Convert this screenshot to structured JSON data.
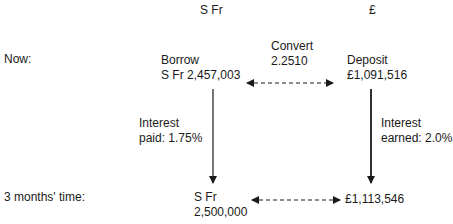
{
  "headers": {
    "left_currency": "S Fr",
    "right_currency": "£"
  },
  "rows": {
    "now": "Now:",
    "later": "3 months' time:"
  },
  "now": {
    "borrow_label": "Borrow",
    "borrow_amount": "S Fr 2,457,003",
    "convert_label": "Convert",
    "convert_rate": "2.2510",
    "deposit_label": "Deposit",
    "deposit_amount": "£1,091,516"
  },
  "interest": {
    "paid_line1": "Interest",
    "paid_line2": "paid: 1.75%",
    "earned_line1": "Interest",
    "earned_line2": "earned: 2.0%"
  },
  "later": {
    "sfr_line1": "S Fr",
    "sfr_line2": "2,500,000",
    "gbp_amount": "£1,113,546"
  },
  "colors": {
    "text": "#1a1a1a",
    "arrow": "#1a1a1a",
    "background": "#ffffff"
  }
}
